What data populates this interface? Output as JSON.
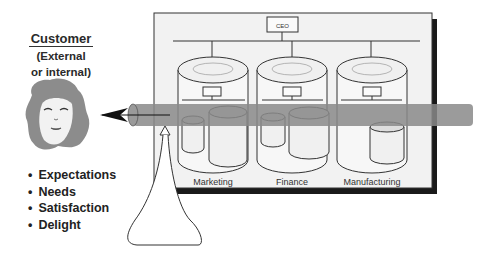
{
  "customer": {
    "title": "Customer",
    "subtitle_line1": "(External",
    "subtitle_line2": "or internal)",
    "icon": "customer-face-icon"
  },
  "attributes": [
    "Expectations",
    "Needs",
    "Satisfaction",
    "Delight"
  ],
  "organization": {
    "top_box": "CEO",
    "departments": [
      "Marketing",
      "Finance",
      "Manufacturing"
    ]
  },
  "colors": {
    "pipe": "#8a8a8a",
    "panel_bg": "#f2f2f2",
    "shadow": "#1a1a1a",
    "hair": "#8c8c8c"
  }
}
